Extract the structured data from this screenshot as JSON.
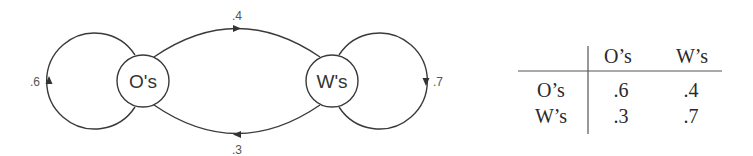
{
  "diagram": {
    "type": "markov-chain-state-diagram",
    "nodes": [
      {
        "id": "O",
        "label": "O's"
      },
      {
        "id": "W",
        "label": "W's"
      }
    ],
    "edges": [
      {
        "from": "O",
        "to": "O",
        "label": ".6"
      },
      {
        "from": "O",
        "to": "W",
        "label": ".4"
      },
      {
        "from": "W",
        "to": "O",
        "label": ".3"
      },
      {
        "from": "W",
        "to": "W",
        "label": ".7"
      }
    ]
  },
  "transition_table": {
    "column_headers": [
      "O’s",
      "W’s"
    ],
    "rows": [
      {
        "label": "O’s",
        "values": [
          ".6",
          ".4"
        ]
      },
      {
        "label": "W’s",
        "values": [
          ".3",
          ".7"
        ]
      }
    ]
  },
  "colors": {
    "stroke": "#3a3a3a",
    "text": "#333333",
    "background": "#ffffff"
  }
}
